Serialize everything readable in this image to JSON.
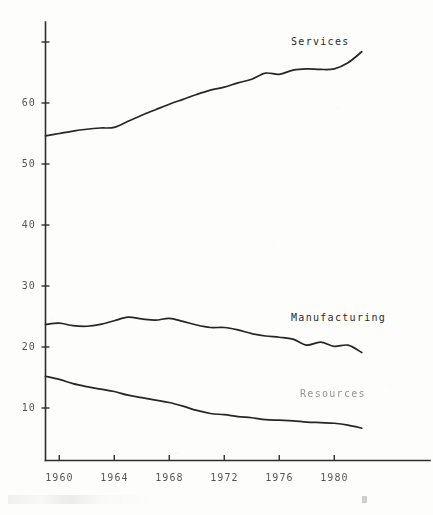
{
  "chart_data": {
    "type": "line",
    "title": "",
    "subtitle": "",
    "xlabel": "",
    "ylabel": "",
    "xlim": [
      1959,
      1982
    ],
    "ylim": [
      0,
      72
    ],
    "grid": false,
    "legend_position": "inline-right",
    "x_ticks": [
      "1960",
      "1964",
      "1968",
      "1972",
      "1976",
      "1980"
    ],
    "x_tick_values": [
      1960,
      1964,
      1968,
      1972,
      1976,
      1980
    ],
    "y_ticks": [
      "10",
      "20",
      "30",
      "40",
      "50",
      "60"
    ],
    "y_tick_values": [
      10,
      20,
      30,
      40,
      50,
      60
    ],
    "x": [
      1959,
      1960,
      1961,
      1962,
      1963,
      1964,
      1965,
      1966,
      1967,
      1968,
      1969,
      1970,
      1971,
      1972,
      1973,
      1974,
      1975,
      1976,
      1977,
      1978,
      1979,
      1980,
      1981,
      1982
    ],
    "series": [
      {
        "name": "Services",
        "values": [
          54.6,
          55.0,
          55.4,
          55.7,
          55.9,
          56.0,
          57.0,
          58.0,
          58.9,
          59.8,
          60.6,
          61.4,
          62.1,
          62.6,
          63.3,
          63.9,
          64.9,
          64.7,
          65.4,
          65.6,
          65.5,
          65.6,
          66.6,
          68.4
        ]
      },
      {
        "name": "Manufacturing",
        "values": [
          23.7,
          23.9,
          23.5,
          23.4,
          23.7,
          24.3,
          24.9,
          24.6,
          24.4,
          24.7,
          24.2,
          23.6,
          23.2,
          23.2,
          22.8,
          22.2,
          21.8,
          21.6,
          21.3,
          20.3,
          20.8,
          20.1,
          20.3,
          19.1
        ]
      },
      {
        "name": "Resources",
        "values": [
          15.2,
          14.7,
          14.0,
          13.5,
          13.1,
          12.7,
          12.1,
          11.7,
          11.3,
          10.9,
          10.3,
          9.6,
          9.1,
          8.9,
          8.6,
          8.4,
          8.1,
          8.0,
          7.9,
          7.7,
          7.6,
          7.5,
          7.2,
          6.7
        ]
      }
    ]
  },
  "labels": {
    "services": "Services",
    "manufacturing": "Manufacturing",
    "resources": "Resources"
  },
  "colors": {
    "line": "#262626",
    "axis": "#2e2e2e",
    "text": "#3a3a3a",
    "background": "#fdfdfc"
  }
}
